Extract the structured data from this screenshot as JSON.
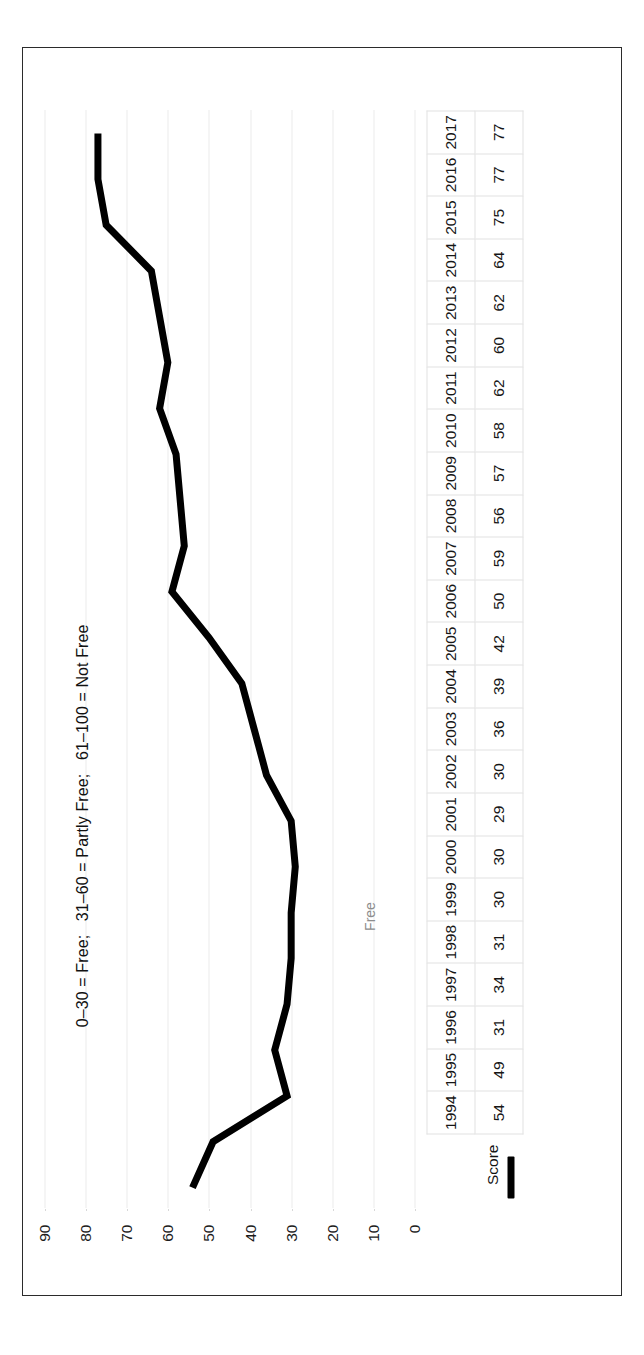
{
  "figure": {
    "orientation": "rotated-90-ccw",
    "caption_fragment": "FIGURE 10.1 Freedom in the World"
  },
  "chart_data": {
    "type": "line",
    "title": "",
    "xlabel": "",
    "ylabel": "",
    "ylim": [
      0,
      90
    ],
    "y_ticks": [
      "90",
      "80",
      "70",
      "60",
      "50",
      "40",
      "30",
      "20",
      "10",
      "0"
    ],
    "grid": true,
    "legend_position": "bottom-table",
    "categories": [
      "1994",
      "1995",
      "1996",
      "1997",
      "1998",
      "1999",
      "2000",
      "2001",
      "2002",
      "2003",
      "2004",
      "2005",
      "2006",
      "2007",
      "2008",
      "2009",
      "2010",
      "2011",
      "2012",
      "2013",
      "2014",
      "2015",
      "2016",
      "2017"
    ],
    "series": [
      {
        "name": "Score",
        "values": [
          54,
          49,
          31,
          34,
          31,
          30,
          30,
          29,
          30,
          36,
          39,
          42,
          50,
          59,
          56,
          57,
          58,
          62,
          60,
          62,
          64,
          75,
          77,
          77
        ],
        "color": "#000000",
        "line_width": 7
      }
    ],
    "annotations": [
      {
        "name": "scale-key",
        "text": "0–30 = Free;   31–60 = Partly Free;   61–100 = Not Free"
      },
      {
        "name": "free-zone-label",
        "text": "Free"
      }
    ]
  },
  "table": {
    "row_header": "Score",
    "legend_series_label": "Score"
  },
  "colors": {
    "line": "#000000",
    "grid": "#d8d8d8",
    "frame": "#2b2b2b",
    "table_border": "#e2e2e2",
    "muted_text": "#8d8d8d"
  }
}
